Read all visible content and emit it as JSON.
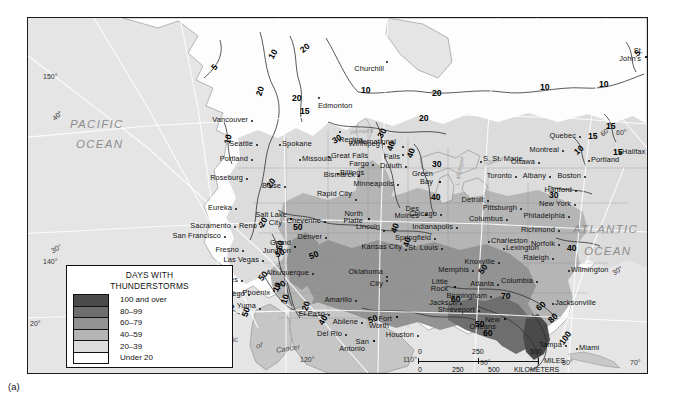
{
  "figure": {
    "caption": "(a)"
  },
  "legend": {
    "title_line1": "DAYS WITH",
    "title_line2": "THUNDERSTORMS",
    "classes": [
      {
        "label": "100 and over",
        "color": "#4a4a4a"
      },
      {
        "label": "80–99",
        "color": "#6e6e6e"
      },
      {
        "label": "60–79",
        "color": "#939393"
      },
      {
        "label": "40–59",
        "color": "#b5b5b5"
      },
      {
        "label": "20–39",
        "color": "#dcdcdc"
      },
      {
        "label": "Under 20",
        "color": "#ffffff"
      }
    ]
  },
  "scale": {
    "miles": {
      "ticks": [
        "0",
        "250",
        "500"
      ],
      "unit": "MILES"
    },
    "kilometers": {
      "ticks": [
        "0",
        "250",
        "500"
      ],
      "unit": "KILOMETERS"
    }
  },
  "ocean_labels": [
    {
      "line1": "PACIFIC",
      "line2": "OCEAN"
    },
    {
      "line1": "ATLANTIC",
      "line2": "OCEAN"
    }
  ],
  "tropic_label": {
    "w1": "Tropic",
    "w2": "of",
    "w3": "Cancer"
  },
  "water_labels": [
    "Winnipeg",
    "L. Michigan",
    "Superior"
  ],
  "graticule_labels": {
    "longitude": [
      "150°",
      "140°",
      "130°",
      "120°",
      "110°",
      "90°",
      "80°",
      "70°",
      "20°"
    ],
    "latitude": [
      "60°",
      "40°",
      "30°",
      "60°",
      "30°",
      "20°"
    ]
  },
  "contour_labels": [
    {
      "v": "5",
      "x": 184,
      "y": 44,
      "r": -52
    },
    {
      "v": "10",
      "x": 240,
      "y": 31,
      "r": -60
    },
    {
      "v": "20",
      "x": 272,
      "y": 25,
      "r": -40
    },
    {
      "v": "20",
      "x": 227,
      "y": 68,
      "r": -72
    },
    {
      "v": "20",
      "x": 264,
      "y": 75,
      "r": 0
    },
    {
      "v": "15",
      "x": 272,
      "y": 88,
      "r": 0
    },
    {
      "v": "10",
      "x": 195,
      "y": 116,
      "r": -78
    },
    {
      "v": "20",
      "x": 238,
      "y": 160,
      "r": -55
    },
    {
      "v": "20",
      "x": 230,
      "y": 199,
      "r": -62
    },
    {
      "v": "10",
      "x": 333,
      "y": 67,
      "r": 0
    },
    {
      "v": "20",
      "x": 404,
      "y": 70,
      "r": 0
    },
    {
      "v": "10",
      "x": 512,
      "y": 64,
      "r": 0
    },
    {
      "v": "10",
      "x": 571,
      "y": 61,
      "r": 0
    },
    {
      "v": "5",
      "x": 607,
      "y": 30,
      "r": -40
    },
    {
      "v": "15",
      "x": 578,
      "y": 103,
      "r": 0
    },
    {
      "v": "15",
      "x": 560,
      "y": 113,
      "r": 0
    },
    {
      "v": "15",
      "x": 585,
      "y": 129,
      "r": 0
    },
    {
      "v": "10",
      "x": 546,
      "y": 127,
      "r": -40
    },
    {
      "v": "30",
      "x": 304,
      "y": 116,
      "r": -30
    },
    {
      "v": "20",
      "x": 391,
      "y": 95,
      "r": 0
    },
    {
      "v": "30",
      "x": 404,
      "y": 141,
      "r": 0
    },
    {
      "v": "40",
      "x": 403,
      "y": 174,
      "r": 0
    },
    {
      "v": "40",
      "x": 358,
      "y": 123,
      "r": -70
    },
    {
      "v": "40",
      "x": 378,
      "y": 130,
      "r": -70
    },
    {
      "v": "30",
      "x": 349,
      "y": 110,
      "r": -60
    },
    {
      "v": "40",
      "x": 362,
      "y": 205,
      "r": -70
    },
    {
      "v": "40",
      "x": 374,
      "y": 219,
      "r": -75
    },
    {
      "v": "50",
      "x": 265,
      "y": 204,
      "r": 0
    },
    {
      "v": "50",
      "x": 247,
      "y": 230,
      "r": -25
    },
    {
      "v": "50",
      "x": 281,
      "y": 232,
      "r": -20
    },
    {
      "v": "60",
      "x": 247,
      "y": 222,
      "r": -78
    },
    {
      "v": "50",
      "x": 230,
      "y": 253,
      "r": -52
    },
    {
      "v": "70",
      "x": 248,
      "y": 262,
      "r": -35
    },
    {
      "v": "50",
      "x": 213,
      "y": 289,
      "r": -70
    },
    {
      "v": "50",
      "x": 186,
      "y": 289,
      "r": -40
    },
    {
      "v": "10",
      "x": 197,
      "y": 285,
      "r": -60
    },
    {
      "v": "5",
      "x": 186,
      "y": 276,
      "r": -45
    },
    {
      "v": "10",
      "x": 244,
      "y": 264,
      "r": -68
    },
    {
      "v": "10",
      "x": 252,
      "y": 276,
      "r": -70
    },
    {
      "v": "20",
      "x": 273,
      "y": 283,
      "r": -70
    },
    {
      "v": "40",
      "x": 290,
      "y": 297,
      "r": -60
    },
    {
      "v": "50",
      "x": 340,
      "y": 296,
      "r": -20
    },
    {
      "v": "60",
      "x": 423,
      "y": 276,
      "r": 0
    },
    {
      "v": "50",
      "x": 450,
      "y": 246,
      "r": -55
    },
    {
      "v": "70",
      "x": 473,
      "y": 273,
      "r": 0
    },
    {
      "v": "60",
      "x": 508,
      "y": 283,
      "r": -40
    },
    {
      "v": "80",
      "x": 520,
      "y": 295,
      "r": -45
    },
    {
      "v": "100",
      "x": 530,
      "y": 315,
      "r": -55
    },
    {
      "v": "40",
      "x": 539,
      "y": 225,
      "r": 0
    },
    {
      "v": "30",
      "x": 521,
      "y": 172,
      "r": 0
    },
    {
      "v": "50",
      "x": 447,
      "y": 301,
      "r": 0
    },
    {
      "v": "60",
      "x": 455,
      "y": 310,
      "r": 0
    }
  ],
  "cities": [
    {
      "n": "Churchill",
      "x": 358,
      "y": 43,
      "dx": -2,
      "dy": 9,
      "a": "r"
    },
    {
      "n": "Edmonton",
      "x": 290,
      "y": 79,
      "dx": 0,
      "dy": 10,
      "a": "c"
    },
    {
      "n": "Regina",
      "x": 311,
      "y": 113,
      "dx": 0,
      "dy": 10,
      "a": "c"
    },
    {
      "n": "Winnipeg",
      "x": 355,
      "y": 125,
      "dx": -3,
      "dy": 2,
      "a": "r"
    },
    {
      "n": "Vancouver",
      "x": 223,
      "y": 102,
      "dx": -3,
      "dy": 1,
      "a": "r"
    },
    {
      "n": "Seattle",
      "x": 228,
      "y": 126,
      "dx": -3,
      "dy": 1,
      "a": "r"
    },
    {
      "n": "Portland",
      "x": 223,
      "y": 141,
      "dx": -3,
      "dy": 1,
      "a": "r"
    },
    {
      "n": "Roseburg",
      "x": 218,
      "y": 160,
      "dx": -3,
      "dy": 1,
      "a": "r"
    },
    {
      "n": "Eureka",
      "x": 207,
      "y": 190,
      "dx": -3,
      "dy": 1,
      "a": "r"
    },
    {
      "n": "Sacramento",
      "x": 206,
      "y": 208,
      "dx": -3,
      "dy": 1,
      "a": "r"
    },
    {
      "n": "San Francisco",
      "x": 196,
      "y": 218,
      "dx": -3,
      "dy": 1,
      "a": "r"
    },
    {
      "n": "Spokane",
      "x": 251,
      "y": 126,
      "dx": 3,
      "dy": 1,
      "a": "l"
    },
    {
      "n": "Missoula",
      "x": 271,
      "y": 141,
      "dx": 3,
      "dy": 1,
      "a": "l"
    },
    {
      "n": "Great Falls",
      "x": 300,
      "y": 138,
      "dx": 3,
      "dy": 1,
      "a": "l"
    },
    {
      "n": "Billings",
      "x": 309,
      "y": 155,
      "dx": 3,
      "dy": 1,
      "a": "l"
    },
    {
      "n": "Boise",
      "x": 256,
      "y": 168,
      "dx": -3,
      "dy": 1,
      "a": "r"
    },
    {
      "n": "Salt Lake",
      "x": 262,
      "y": 200,
      "dx": -3,
      "dy": -2,
      "a": "r"
    },
    {
      "n": "City",
      "x": 262,
      "y": 200,
      "dx": -8,
      "dy": 6,
      "a": "r"
    },
    {
      "n": "Reno",
      "x": 232,
      "y": 208,
      "dx": -3,
      "dy": 1,
      "a": "r"
    },
    {
      "n": "Fresno",
      "x": 214,
      "y": 232,
      "dx": -3,
      "dy": 1,
      "a": "r"
    },
    {
      "n": "Las Vegas",
      "x": 234,
      "y": 242,
      "dx": -3,
      "dy": 1,
      "a": "r"
    },
    {
      "n": "Los Angeles",
      "x": 213,
      "y": 262,
      "dx": -3,
      "dy": 1,
      "a": "r"
    },
    {
      "n": "San Diego",
      "x": 220,
      "y": 276,
      "dx": -3,
      "dy": 1,
      "a": "r"
    },
    {
      "n": "Yuma",
      "x": 231,
      "y": 290,
      "dx": -3,
      "dy": -1,
      "a": "r"
    },
    {
      "n": "Phoenix",
      "x": 245,
      "y": 272,
      "dx": -3,
      "dy": 4,
      "a": "r"
    },
    {
      "n": "Albuquerque",
      "x": 284,
      "y": 255,
      "dx": -3,
      "dy": 1,
      "a": "r"
    },
    {
      "n": "Grand",
      "x": 266,
      "y": 228,
      "dx": -3,
      "dy": -2,
      "a": "r"
    },
    {
      "n": "Junction",
      "x": 266,
      "y": 228,
      "dx": -3,
      "dy": 6,
      "a": "r"
    },
    {
      "n": "Denver",
      "x": 297,
      "y": 219,
      "dx": -3,
      "dy": 1,
      "a": "r"
    },
    {
      "n": "Cheyenne",
      "x": 296,
      "y": 203,
      "dx": -3,
      "dy": 1,
      "a": "r"
    },
    {
      "n": "Rapid City",
      "x": 327,
      "y": 181,
      "dx": -3,
      "dy": -4,
      "a": "r"
    },
    {
      "n": "North",
      "x": 340,
      "y": 200,
      "dx": -5,
      "dy": -3,
      "a": "r"
    },
    {
      "n": "Platte",
      "x": 340,
      "y": 200,
      "dx": -5,
      "dy": 4,
      "a": "r"
    },
    {
      "n": "Lincoln",
      "x": 355,
      "y": 212,
      "dx": -3,
      "dy": -2,
      "a": "r"
    },
    {
      "n": "Kansas City",
      "x": 377,
      "y": 231,
      "dx": -3,
      "dy": -1,
      "a": "r"
    },
    {
      "n": "Des",
      "x": 397,
      "y": 196,
      "dx": -6,
      "dy": -4,
      "a": "r"
    },
    {
      "n": "Moines",
      "x": 397,
      "y": 196,
      "dx": -6,
      "dy": 3,
      "a": "r"
    },
    {
      "n": "Bismarck",
      "x": 330,
      "y": 157,
      "dx": -3,
      "dy": 1,
      "a": "r"
    },
    {
      "n": "Fargo",
      "x": 344,
      "y": 146,
      "dx": -3,
      "dy": 1,
      "a": "r"
    },
    {
      "n": "Minneapolis",
      "x": 369,
      "y": 166,
      "dx": -3,
      "dy": 1,
      "a": "r"
    },
    {
      "n": "Duluth",
      "x": 377,
      "y": 148,
      "dx": -3,
      "dy": 1,
      "a": "r"
    },
    {
      "n": "International",
      "x": 374,
      "y": 128,
      "dx": -6,
      "dy": -3,
      "a": "r"
    },
    {
      "n": "Falls",
      "x": 374,
      "y": 136,
      "dx": -2,
      "dy": 4,
      "a": "r"
    },
    {
      "n": "Green",
      "x": 411,
      "y": 163,
      "dx": -6,
      "dy": -6,
      "a": "r"
    },
    {
      "n": "Bay",
      "x": 411,
      "y": 163,
      "dx": -6,
      "dy": 2,
      "a": "r"
    },
    {
      "n": "S. St. Marie",
      "x": 452,
      "y": 143,
      "dx": 3,
      "dy": -1,
      "a": "l"
    },
    {
      "n": "Chicago",
      "x": 412,
      "y": 196,
      "dx": -3,
      "dy": 1,
      "a": "r"
    },
    {
      "n": "Indianapolis",
      "x": 428,
      "y": 209,
      "dx": -3,
      "dy": 1,
      "a": "r"
    },
    {
      "n": "Springfield",
      "x": 406,
      "y": 220,
      "dx": -3,
      "dy": 1,
      "a": "r"
    },
    {
      "n": "St. Louis",
      "x": 413,
      "y": 230,
      "dx": -3,
      "dy": 1,
      "a": "r"
    },
    {
      "n": "Detroit",
      "x": 459,
      "y": 182,
      "dx": -3,
      "dy": 1,
      "a": "r"
    },
    {
      "n": "Toronto",
      "x": 487,
      "y": 158,
      "dx": -3,
      "dy": 1,
      "a": "r"
    },
    {
      "n": "Ottawa",
      "x": 510,
      "y": 144,
      "dx": -3,
      "dy": 1,
      "a": "r"
    },
    {
      "n": "Montreal",
      "x": 534,
      "y": 132,
      "dx": -3,
      "dy": 1,
      "a": "r"
    },
    {
      "n": "Quebec",
      "x": 551,
      "y": 118,
      "dx": -3,
      "dy": 1,
      "a": "r"
    },
    {
      "n": "Albany",
      "x": 521,
      "y": 158,
      "dx": -3,
      "dy": 1,
      "a": "r"
    },
    {
      "n": "Boston",
      "x": 556,
      "y": 158,
      "dx": -3,
      "dy": 1,
      "a": "r"
    },
    {
      "n": "Portland",
      "x": 560,
      "y": 142,
      "dx": 3,
      "dy": 1,
      "a": "l"
    },
    {
      "n": "Hartford",
      "x": 547,
      "y": 172,
      "dx": -3,
      "dy": 1,
      "a": "r"
    },
    {
      "n": "New York",
      "x": 546,
      "y": 186,
      "dx": -3,
      "dy": 1,
      "a": "r"
    },
    {
      "n": "Philadelphia",
      "x": 540,
      "y": 198,
      "dx": -3,
      "dy": 1,
      "a": "r"
    },
    {
      "n": "Pittsburgh",
      "x": 492,
      "y": 190,
      "dx": -3,
      "dy": 1,
      "a": "r"
    },
    {
      "n": "Columbus",
      "x": 478,
      "y": 201,
      "dx": -3,
      "dy": 1,
      "a": "r"
    },
    {
      "n": "Charleston",
      "x": 460,
      "y": 223,
      "dx": 3,
      "dy": 1,
      "a": "l"
    },
    {
      "n": "Richmond",
      "x": 530,
      "y": 212,
      "dx": -3,
      "dy": 1,
      "a": "r"
    },
    {
      "n": "Norfolk",
      "x": 530,
      "y": 226,
      "dx": -3,
      "dy": 1,
      "a": "r"
    },
    {
      "n": "Raleigh",
      "x": 524,
      "y": 240,
      "dx": -3,
      "dy": 1,
      "a": "r"
    },
    {
      "n": "Lexington",
      "x": 475,
      "y": 230,
      "dx": 3,
      "dy": 1,
      "a": "l"
    },
    {
      "n": "Knoxville",
      "x": 470,
      "y": 244,
      "dx": -3,
      "dy": 1,
      "a": "r"
    },
    {
      "n": "Memphis",
      "x": 444,
      "y": 252,
      "dx": -3,
      "dy": 1,
      "a": "r"
    },
    {
      "n": "Wilmington",
      "x": 540,
      "y": 252,
      "dx": 3,
      "dy": 1,
      "a": "l"
    },
    {
      "n": "Columbia",
      "x": 508,
      "y": 263,
      "dx": -3,
      "dy": 1,
      "a": "r"
    },
    {
      "n": "Atlanta",
      "x": 469,
      "y": 266,
      "dx": -3,
      "dy": 1,
      "a": "r"
    },
    {
      "n": "Birmingham",
      "x": 462,
      "y": 278,
      "dx": -3,
      "dy": 1,
      "a": "r"
    },
    {
      "n": "Jacksonville",
      "x": 524,
      "y": 285,
      "dx": 3,
      "dy": 1,
      "a": "l"
    },
    {
      "n": "Little",
      "x": 426,
      "y": 268,
      "dx": -6,
      "dy": -3,
      "a": "r"
    },
    {
      "n": "Rock",
      "x": 426,
      "y": 268,
      "dx": -6,
      "dy": 4,
      "a": "r"
    },
    {
      "n": "Jackson",
      "x": 432,
      "y": 285,
      "dx": -3,
      "dy": 1,
      "a": "r"
    },
    {
      "n": "Shreveport",
      "x": 450,
      "y": 292,
      "dx": -3,
      "dy": 1,
      "a": "r"
    },
    {
      "n": "New",
      "x": 476,
      "y": 300,
      "dx": -4,
      "dy": 3,
      "a": "r"
    },
    {
      "n": "Orleans",
      "x": 476,
      "y": 300,
      "dx": -8,
      "dy": 10,
      "a": "r"
    },
    {
      "n": "Tampa",
      "x": 537,
      "y": 327,
      "dx": -3,
      "dy": 1,
      "a": "r"
    },
    {
      "n": "Miami",
      "x": 548,
      "y": 330,
      "dx": 3,
      "dy": 1,
      "a": "l"
    },
    {
      "n": "Oklahoma",
      "x": 358,
      "y": 258,
      "dx": -3,
      "dy": -3,
      "a": "r"
    },
    {
      "n": "City",
      "x": 358,
      "y": 262,
      "dx": -3,
      "dy": 5,
      "a": "r"
    },
    {
      "n": "Amarillo",
      "x": 327,
      "y": 282,
      "dx": -3,
      "dy": 1,
      "a": "r"
    },
    {
      "n": "Abilene",
      "x": 333,
      "y": 304,
      "dx": -3,
      "dy": 1,
      "a": "r"
    },
    {
      "n": "Fort",
      "x": 368,
      "y": 298,
      "dx": -4,
      "dy": 4,
      "a": "r"
    },
    {
      "n": "Worth",
      "x": 368,
      "y": 298,
      "dx": -7,
      "dy": 11,
      "a": "r"
    },
    {
      "n": "Houston",
      "x": 389,
      "y": 317,
      "dx": -3,
      "dy": 1,
      "a": "r"
    },
    {
      "n": "San",
      "x": 345,
      "y": 322,
      "dx": -4,
      "dy": 3,
      "a": "r"
    },
    {
      "n": "Antonio",
      "x": 345,
      "y": 322,
      "dx": -8,
      "dy": 10,
      "a": "r"
    },
    {
      "n": "Del Rio",
      "x": 317,
      "y": 316,
      "dx": -3,
      "dy": 1,
      "a": "r"
    },
    {
      "n": "El Paso",
      "x": 300,
      "y": 296,
      "dx": -3,
      "dy": 1,
      "a": "r"
    },
    {
      "n": "Halifax",
      "x": 591,
      "y": 134,
      "dx": 3,
      "dy": 1,
      "a": "l"
    },
    {
      "n": "St.",
      "x": 617,
      "y": 38,
      "dx": -2,
      "dy": -4,
      "a": "r"
    },
    {
      "n": "John's",
      "x": 617,
      "y": 38,
      "dx": -4,
      "dy": 4,
      "a": "r"
    }
  ]
}
